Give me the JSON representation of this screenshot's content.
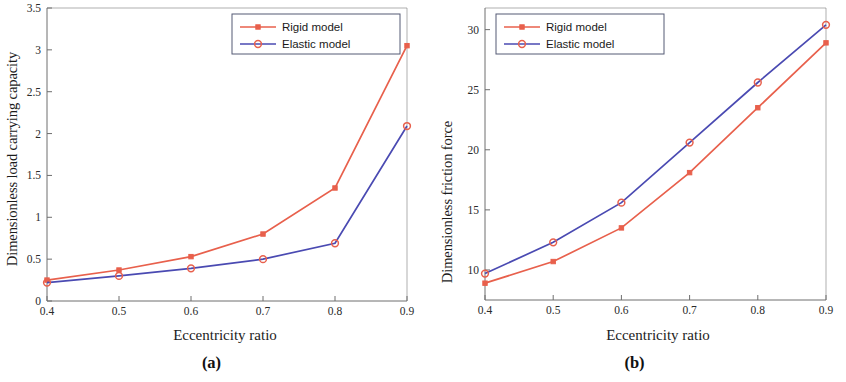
{
  "figure": {
    "panels": [
      {
        "id": "a",
        "caption": "(a)",
        "ylabel": "Dimensionless load carrying capacity",
        "xlabel": "Eccentricity ratio"
      },
      {
        "id": "b",
        "caption": "(b)",
        "ylabel": "Dimensionless friction force",
        "xlabel": "Eccentricity ratio"
      }
    ],
    "legend": {
      "rigid_label": "Rigid model",
      "elastic_label": "Elastic model"
    },
    "colors": {
      "rigid": "#e8604c",
      "elastic": "#4a4ab2",
      "axis": "#6e6e6e",
      "legend_border": "#555a75",
      "background": "#ffffff"
    }
  },
  "chart_data": [
    {
      "type": "line",
      "panel": "a",
      "title": "",
      "xlabel": "Eccentricity ratio",
      "ylabel": "Dimensionless load carrying capacity",
      "x": [
        0.4,
        0.5,
        0.6,
        0.7,
        0.8,
        0.9
      ],
      "xticks": [
        "0.4",
        "0.5",
        "0.6",
        "0.7",
        "0.8",
        "0.9"
      ],
      "yticks": [
        "0",
        "0.5",
        "1",
        "1.5",
        "2",
        "2.5",
        "3",
        "3.5"
      ],
      "xlim": [
        0.4,
        0.9
      ],
      "ylim": [
        0,
        3.5
      ],
      "grid": false,
      "legend_position": "top-right",
      "series": [
        {
          "name": "Rigid model",
          "marker": "filled-square",
          "color": "#e8604c",
          "values": [
            0.25,
            0.37,
            0.53,
            0.8,
            1.35,
            3.05
          ]
        },
        {
          "name": "Elastic model",
          "marker": "open-circle",
          "color": "#4a4ab2",
          "values": [
            0.22,
            0.3,
            0.39,
            0.5,
            0.69,
            2.09
          ]
        }
      ]
    },
    {
      "type": "line",
      "panel": "b",
      "title": "",
      "xlabel": "Eccentricity ratio",
      "ylabel": "Dimensionless friction force",
      "x": [
        0.4,
        0.5,
        0.6,
        0.7,
        0.8,
        0.9
      ],
      "xticks": [
        "0.4",
        "0.5",
        "0.6",
        "0.7",
        "0.8",
        "0.9"
      ],
      "yticks": [
        "10",
        "15",
        "20",
        "25",
        "30"
      ],
      "xlim": [
        0.4,
        0.9
      ],
      "ylim": [
        7.5,
        31.8
      ],
      "grid": false,
      "legend_position": "top-left",
      "series": [
        {
          "name": "Rigid model",
          "marker": "filled-square",
          "color": "#e8604c",
          "values": [
            8.9,
            10.7,
            13.5,
            18.1,
            23.5,
            28.9
          ]
        },
        {
          "name": "Elastic model",
          "marker": "open-circle",
          "color": "#4a4ab2",
          "values": [
            9.7,
            12.3,
            15.6,
            20.6,
            25.6,
            30.4
          ]
        }
      ]
    }
  ]
}
